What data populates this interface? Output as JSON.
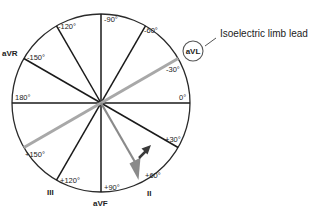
{
  "diagram": {
    "type": "hexaxial-reference-system",
    "center": {
      "x": 101,
      "y": 103
    },
    "radius": 89,
    "colors": {
      "axis": "#1a1a1a",
      "isoelectric_axis": "#a8a8a8",
      "electrical_axis_arrow": "#8a8a8a",
      "direction_arrow": "#3a3a3a",
      "circle": "#2a2a2a"
    },
    "degree_labels": {
      "m120": "-120°",
      "m90": "-90°",
      "m60": "-60°",
      "m150": "-150°",
      "m30": "-30°",
      "d180": "180°",
      "d0": "0°",
      "p150": "+150°",
      "p30": "+30°",
      "p120": "+120°",
      "p90": "+90°",
      "p60": "+60°"
    },
    "lead_labels": {
      "avr": "aVR",
      "avl": "aVL",
      "iii": "III",
      "avf": "aVF",
      "ii": "II"
    },
    "callout": {
      "text": "Isoelectric limb lead",
      "target_lead": "aVL"
    }
  }
}
